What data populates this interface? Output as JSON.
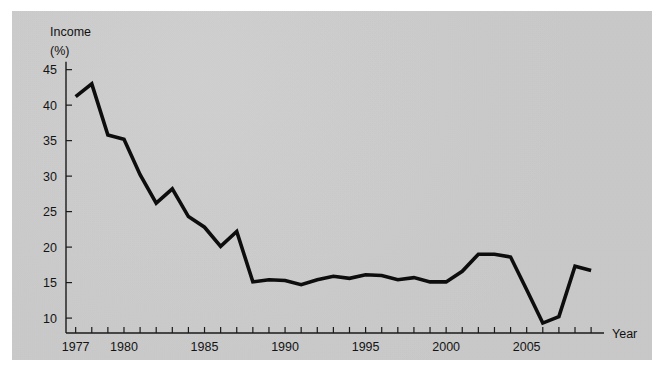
{
  "figure": {
    "background_color": "#ffffff",
    "panel_color": "#cfcfcf",
    "line_color": "#0d0d0d",
    "axis_color": "#1a1a1a"
  },
  "footer": {
    "caption_fragment": ""
  },
  "chart_data": {
    "type": "line",
    "title": "",
    "subtitle": "",
    "ylabel": "Income",
    "ylabel_unit": "(%)",
    "xlabel": "Year",
    "ylim": [
      7.9,
      46.5
    ],
    "xlim": [
      1976.4,
      2009.8
    ],
    "grid": false,
    "legend": null,
    "y_ticks": [
      10,
      15,
      20,
      25,
      30,
      35,
      40,
      45
    ],
    "y_tick_labels": [
      "10",
      "15",
      "20",
      "25",
      "30",
      "35",
      "40",
      "45"
    ],
    "x_ticks": [
      1977,
      1978,
      1979,
      1980,
      1981,
      1982,
      1983,
      1984,
      1985,
      1986,
      1987,
      1988,
      1989,
      1990,
      1991,
      1992,
      1993,
      1994,
      1995,
      1996,
      1997,
      1998,
      1999,
      2000,
      2001,
      2002,
      2003,
      2004,
      2005,
      2006,
      2007,
      2008,
      2009
    ],
    "x_tick_labels_shown": [
      "1977",
      "1980",
      "1985",
      "1990",
      "1995",
      "2000",
      "2005"
    ],
    "x_labeled_ticks": [
      1977,
      1980,
      1985,
      1990,
      1995,
      2000,
      2005
    ],
    "series": [
      {
        "name": "Income (%)",
        "x": [
          1977,
          1978,
          1979,
          1980,
          1981,
          1982,
          1983,
          1984,
          1985,
          1986,
          1987,
          1988,
          1989,
          1990,
          1991,
          1992,
          1993,
          1994,
          1995,
          1996,
          1997,
          1998,
          1999,
          2000,
          2001,
          2002,
          2003,
          2004,
          2005,
          2006,
          2007,
          2008,
          2009
        ],
        "values": [
          41.2,
          43.0,
          35.8,
          35.2,
          30.2,
          26.2,
          28.2,
          24.3,
          22.8,
          20.1,
          22.2,
          15.1,
          15.4,
          15.3,
          14.7,
          15.4,
          15.9,
          15.6,
          16.1,
          16.0,
          15.4,
          15.7,
          15.1,
          15.1,
          16.6,
          19.0,
          19.0,
          18.6,
          14.0,
          9.3,
          10.2,
          17.3,
          16.7
        ]
      }
    ]
  }
}
